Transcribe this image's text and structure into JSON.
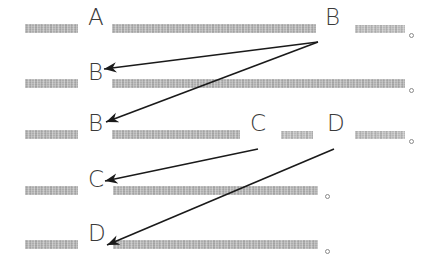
{
  "canvas": {
    "width": 443,
    "height": 269,
    "background": "#ffffff"
  },
  "style": {
    "bar_color": "#a9a9a9",
    "glyph_color": "#3a3a3a",
    "arrow_color": "#1a1a1a",
    "dot_border_color": "#8a8a8a"
  },
  "lines": [
    {
      "id": "line-1",
      "y": 24,
      "bars": [
        {
          "x": 25,
          "width": 53,
          "height": 9
        },
        {
          "x": 112,
          "width": 204,
          "height": 9
        },
        {
          "x": 355,
          "width": 50,
          "height": 8
        }
      ],
      "glyphs": [
        {
          "label": "A",
          "x": 88,
          "y": 20
        },
        {
          "label": "B",
          "x": 325,
          "y": 20
        }
      ],
      "dots": [
        {
          "x": 409,
          "y": 33
        }
      ]
    },
    {
      "id": "line-2",
      "y": 79,
      "bars": [
        {
          "x": 25,
          "width": 53,
          "height": 9
        },
        {
          "x": 112,
          "width": 293,
          "height": 9
        }
      ],
      "glyphs": [
        {
          "label": "B",
          "x": 88,
          "y": 75
        }
      ],
      "dots": [
        {
          "x": 409,
          "y": 88
        }
      ]
    },
    {
      "id": "line-3",
      "y": 130,
      "bars": [
        {
          "x": 25,
          "width": 53,
          "height": 9
        },
        {
          "x": 112,
          "width": 128,
          "height": 9
        },
        {
          "x": 281,
          "width": 32,
          "height": 8
        },
        {
          "x": 355,
          "width": 50,
          "height": 8
        }
      ],
      "glyphs": [
        {
          "label": "B",
          "x": 88,
          "y": 126
        },
        {
          "label": "C",
          "x": 250,
          "y": 126
        },
        {
          "label": "D",
          "x": 327,
          "y": 126
        }
      ],
      "dots": [
        {
          "x": 409,
          "y": 139
        }
      ]
    },
    {
      "id": "line-4",
      "y": 186,
      "bars": [
        {
          "x": 25,
          "width": 53,
          "height": 9
        },
        {
          "x": 113,
          "width": 205,
          "height": 9
        }
      ],
      "glyphs": [
        {
          "label": "C",
          "x": 88,
          "y": 182
        }
      ],
      "dots": [
        {
          "x": 325,
          "y": 194
        }
      ]
    },
    {
      "id": "line-5",
      "y": 240,
      "bars": [
        {
          "x": 25,
          "width": 53,
          "height": 9
        },
        {
          "x": 113,
          "width": 205,
          "height": 9
        }
      ],
      "glyphs": [
        {
          "label": "D",
          "x": 88,
          "y": 236
        }
      ],
      "dots": [
        {
          "x": 325,
          "y": 249
        }
      ]
    }
  ],
  "arrows": [
    {
      "id": "arrow-b1-to-b2",
      "from_label": "B",
      "to_label": "B",
      "x1": 318,
      "y1": 42,
      "x2": 104,
      "y2": 69
    },
    {
      "id": "arrow-b1-to-b3",
      "from_label": "B",
      "to_label": "B",
      "x1": 318,
      "y1": 42,
      "x2": 106,
      "y2": 122
    },
    {
      "id": "arrow-c3-to-c4",
      "from_label": "C",
      "to_label": "C",
      "x1": 258,
      "y1": 149,
      "x2": 105,
      "y2": 181
    },
    {
      "id": "arrow-d3-to-d5",
      "from_label": "D",
      "to_label": "D",
      "x1": 334,
      "y1": 149,
      "x2": 107,
      "y2": 245
    }
  ]
}
